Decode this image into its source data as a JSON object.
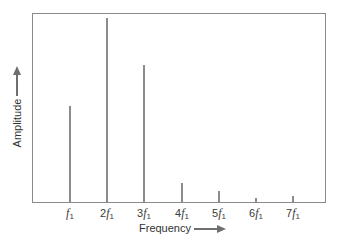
{
  "chart_data": {
    "type": "bar",
    "title": "",
    "xlabel": "Frequency",
    "ylabel": "Amplitude",
    "categories": [
      "f1",
      "2f1",
      "3f1",
      "4f1",
      "5f1",
      "6f1",
      "7f1"
    ],
    "tick_labels": [
      {
        "coef": "",
        "sym": "f",
        "sub": "1"
      },
      {
        "coef": "2",
        "sym": "f",
        "sub": "1"
      },
      {
        "coef": "3",
        "sym": "f",
        "sub": "1"
      },
      {
        "coef": "4",
        "sym": "f",
        "sub": "1"
      },
      {
        "coef": "5",
        "sym": "f",
        "sub": "1"
      },
      {
        "coef": "6",
        "sym": "f",
        "sub": "1"
      },
      {
        "coef": "7",
        "sym": "f",
        "sub": "1"
      }
    ],
    "values": [
      0.51,
      0.98,
      0.73,
      0.1,
      0.06,
      0.02,
      0.03
    ],
    "ylim": [
      0,
      1.0
    ],
    "grid": false,
    "legend": null,
    "axis_arrows": true
  },
  "layout": {
    "bar_x": [
      70,
      107,
      144,
      182,
      219,
      256,
      293
    ],
    "plot_left": 32,
    "plot_bottom": 203,
    "plot_height": 190
  }
}
